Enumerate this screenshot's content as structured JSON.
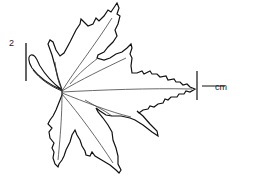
{
  "figure": {
    "scale_bar_left": {
      "label": "2",
      "orientation": "vertical"
    },
    "scale_bar_right": {
      "label": "cm",
      "orientation": "horizontal"
    }
  },
  "colors": {
    "stroke": "#111111",
    "vein": "#444444",
    "background": "#ffffff"
  }
}
